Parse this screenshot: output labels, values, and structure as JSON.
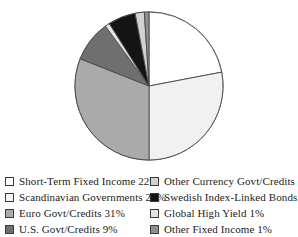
{
  "figure": {
    "title_remnant": "Fixed Income Portfolio Allocation",
    "background": "#ffffff"
  },
  "chart_data": {
    "type": "pie",
    "title": "",
    "xlabel": "",
    "ylabel": "",
    "legend_position": "bottom",
    "grid": false,
    "start_angle_deg": 0,
    "direction": "clockwise",
    "units": "percent",
    "categories": [
      "Short-Term Fixed Income",
      "Scandinavian Governments",
      "Euro Govt/Credits",
      "U.S. Govt/Credits",
      "Global High Yield",
      "Swedish Index-Linked Bonds",
      "Other Currency Govt/Credits",
      "Other Fixed Income"
    ],
    "values": [
      22,
      28,
      31,
      9,
      1,
      6,
      2,
      1
    ],
    "colors": [
      "#ffffff",
      "#f1f1f1",
      "#aaaaaa",
      "#6f6f6f",
      "#e2e2e2",
      "#141414",
      "#d2d2d2",
      "#8e8e8e"
    ],
    "slice_border": "#4a4a4a",
    "slices": [
      {
        "label": "Short-Term Fixed Income",
        "value": 22,
        "display": "22%",
        "color": "#ffffff"
      },
      {
        "label": "Scandinavian Governments",
        "value": 28,
        "display": "28%",
        "color": "#f1f1f1"
      },
      {
        "label": "Euro Govt/Credits",
        "value": 31,
        "display": "31%",
        "color": "#aaaaaa"
      },
      {
        "label": "U.S. Govt/Credits",
        "value": 9,
        "display": "9%",
        "color": "#6f6f6f"
      },
      {
        "label": "Global High Yield",
        "value": 1,
        "display": "1%",
        "color": "#e2e2e2"
      },
      {
        "label": "Swedish Index-Linked Bonds",
        "value": 6,
        "display": "6%",
        "color": "#141414"
      },
      {
        "label": "Other Currency Govt/Credits",
        "value": 2,
        "display": "2%",
        "color": "#d2d2d2"
      },
      {
        "label": "Other Fixed Income",
        "value": 1,
        "display": "1%",
        "color": "#8e8e8e"
      }
    ]
  },
  "legend": {
    "left_column": [
      {
        "text": "Short-Term Fixed Income 22%",
        "color": "#ffffff",
        "name": "legend-short-term-fixed-income"
      },
      {
        "text": "Scandinavian Governments 28%",
        "color": "#f6f6f6",
        "name": "legend-scandinavian-governments"
      },
      {
        "text": "Euro Govt/Credits 31%",
        "color": "#aaaaaa",
        "name": "legend-euro-govt-credits"
      },
      {
        "text": "U.S. Govt/Credits 9%",
        "color": "#6f6f6f",
        "name": "legend-us-govt-credits"
      }
    ],
    "right_column": [
      {
        "text": "Other Currency Govt/Credits 2%",
        "color": "#d2d2d2",
        "name": "legend-other-currency-govt-credits"
      },
      {
        "text": "Swedish Index-Linked Bonds 6%",
        "color": "#141414",
        "name": "legend-swedish-index-linked-bonds"
      },
      {
        "text": "Global High Yield 1%",
        "color": "#e2e2e2",
        "name": "legend-global-high-yield"
      },
      {
        "text": "Other Fixed Income 1%",
        "color": "#8e8e8e",
        "name": "legend-other-fixed-income"
      }
    ]
  }
}
